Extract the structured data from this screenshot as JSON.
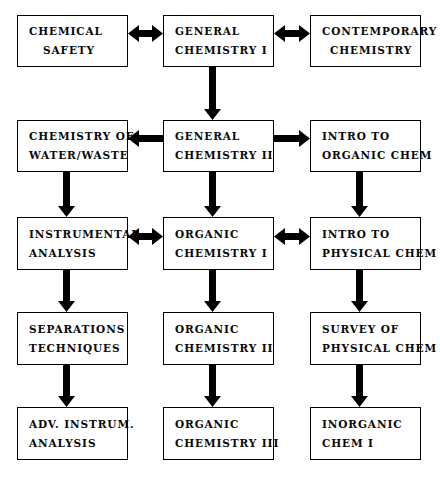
{
  "diagram": {
    "background_color": "#ffffff",
    "line_color": "#000000",
    "text_color": "#0a0a0a"
  },
  "nodes": [
    {
      "id": "chemical-safety",
      "row": 1,
      "column": "left",
      "line1": "CHEMICAL",
      "line2": "SAFETY",
      "x": 17,
      "y": 15,
      "w": 111,
      "h": 52
    },
    {
      "id": "general-chemistry-i",
      "row": 1,
      "column": "middle",
      "line1": "GENERAL",
      "line2": "CHEMISTRY I",
      "x": 163,
      "y": 15,
      "w": 111,
      "h": 52
    },
    {
      "id": "contemporary-chemistry",
      "row": 1,
      "column": "right",
      "line1": "CONTEMPORARY",
      "line2": "CHEMISTRY",
      "x": 310,
      "y": 15,
      "w": 111,
      "h": 52
    },
    {
      "id": "chemistry-of-water-waste",
      "row": 2,
      "column": "left",
      "line1": "CHEMISTRY OF",
      "line2": "WATER/WASTE",
      "x": 17,
      "y": 120,
      "w": 111,
      "h": 52
    },
    {
      "id": "general-chemistry-ii",
      "row": 2,
      "column": "middle",
      "line1": "GENERAL",
      "line2": "CHEMISTRY II",
      "x": 163,
      "y": 120,
      "w": 111,
      "h": 52
    },
    {
      "id": "intro-to-organic-chem",
      "row": 2,
      "column": "right",
      "line1": "INTRO TO",
      "line2": "ORGANIC CHEM",
      "x": 310,
      "y": 120,
      "w": 111,
      "h": 52
    },
    {
      "id": "instrumental-analysis",
      "row": 3,
      "column": "left",
      "line1": "INSTRUMENTAL",
      "line2": "ANALYSIS",
      "x": 17,
      "y": 217,
      "w": 111,
      "h": 53
    },
    {
      "id": "organic-chemistry-i",
      "row": 3,
      "column": "middle",
      "line1": "ORGANIC",
      "line2": "CHEMISTRY I",
      "x": 163,
      "y": 217,
      "w": 111,
      "h": 53
    },
    {
      "id": "intro-to-physical-chem",
      "row": 3,
      "column": "right",
      "line1": "INTRO TO",
      "line2": "PHYSICAL CHEM",
      "x": 310,
      "y": 217,
      "w": 111,
      "h": 53
    },
    {
      "id": "separations-techniques",
      "row": 4,
      "column": "left",
      "line1": "SEPARATIONS",
      "line2": "TECHNIQUES",
      "x": 17,
      "y": 312,
      "w": 111,
      "h": 53
    },
    {
      "id": "organic-chemistry-ii",
      "row": 4,
      "column": "middle",
      "line1": "ORGANIC",
      "line2": "CHEMISTRY II",
      "x": 163,
      "y": 312,
      "w": 111,
      "h": 53
    },
    {
      "id": "survey-of-physical-chem",
      "row": 4,
      "column": "right",
      "line1": "SURVEY OF",
      "line2": "PHYSICAL CHEM",
      "x": 310,
      "y": 312,
      "w": 111,
      "h": 53
    },
    {
      "id": "adv-instrum-analysis",
      "row": 5,
      "column": "left",
      "line1": "ADV. INSTRUM.",
      "line2": "ANALYSIS",
      "x": 17,
      "y": 407,
      "w": 111,
      "h": 53
    },
    {
      "id": "organic-chemistry-iii",
      "row": 5,
      "column": "middle",
      "line1": "ORGANIC",
      "line2": "CHEMISTRY III",
      "x": 163,
      "y": 407,
      "w": 111,
      "h": 53
    },
    {
      "id": "inorganic-chem-i",
      "row": 5,
      "column": "right",
      "line1": "INORGANIC",
      "line2": "CHEM I",
      "x": 310,
      "y": 407,
      "w": 111,
      "h": 53
    }
  ],
  "connectors": [
    {
      "id": "chemical-safety-general-chemistry-i",
      "direction": "horizontal-both",
      "x": 128,
      "y": 33,
      "len": 35
    },
    {
      "id": "general-chemistry-i-contemporary-chemistry",
      "direction": "horizontal-both",
      "x": 274,
      "y": 33,
      "len": 36
    },
    {
      "id": "general-chemistry-i-general-chemistry-ii",
      "direction": "vertical-down",
      "x": 212,
      "y": 67,
      "len": 53
    },
    {
      "id": "general-chemistry-ii-chemistry-of-water-waste",
      "direction": "horizontal-left",
      "x": 128,
      "y": 138,
      "len": 35
    },
    {
      "id": "general-chemistry-ii-intro-to-organic-chem",
      "direction": "horizontal-right",
      "x": 274,
      "y": 138,
      "len": 36
    },
    {
      "id": "chemistry-of-water-waste-instrumental-analysis",
      "direction": "vertical-down",
      "x": 66,
      "y": 172,
      "len": 45
    },
    {
      "id": "general-chemistry-ii-organic-chemistry-i",
      "direction": "vertical-down",
      "x": 212,
      "y": 172,
      "len": 45
    },
    {
      "id": "intro-to-organic-chem-intro-to-physical-chem",
      "direction": "vertical-down",
      "x": 359,
      "y": 172,
      "len": 45
    },
    {
      "id": "instrumental-analysis-organic-chemistry-i",
      "direction": "horizontal-both",
      "x": 128,
      "y": 236,
      "len": 35
    },
    {
      "id": "organic-chemistry-i-intro-to-physical-chem",
      "direction": "horizontal-both",
      "x": 274,
      "y": 236,
      "len": 36
    },
    {
      "id": "instrumental-analysis-separations-techniques",
      "direction": "vertical-down",
      "x": 66,
      "y": 270,
      "len": 42
    },
    {
      "id": "organic-chemistry-i-organic-chemistry-ii",
      "direction": "vertical-down",
      "x": 212,
      "y": 270,
      "len": 42
    },
    {
      "id": "intro-to-physical-chem-survey-of-physical-chem",
      "direction": "vertical-down",
      "x": 359,
      "y": 270,
      "len": 42
    },
    {
      "id": "separations-techniques-adv-instrum-analysis",
      "direction": "vertical-down",
      "x": 66,
      "y": 365,
      "len": 42
    },
    {
      "id": "organic-chemistry-ii-organic-chemistry-iii",
      "direction": "vertical-down",
      "x": 212,
      "y": 365,
      "len": 42
    },
    {
      "id": "survey-of-physical-chem-inorganic-chem-i",
      "direction": "vertical-down",
      "x": 359,
      "y": 365,
      "len": 42
    }
  ]
}
